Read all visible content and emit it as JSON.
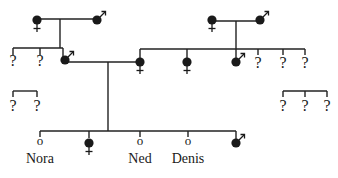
{
  "diagram": {
    "type": "pedigree",
    "colors": {
      "ink": "#1a1a1a",
      "background": "#ffffff"
    },
    "unknown_label": "?",
    "individuals": [
      {
        "id": "lgm",
        "sex": "female",
        "status": "affected",
        "x": 37,
        "y": 20
      },
      {
        "id": "lgf",
        "sex": "male",
        "status": "affected",
        "x": 97,
        "y": 20
      },
      {
        "id": "rgm",
        "sex": "female",
        "status": "affected",
        "x": 212,
        "y": 20
      },
      {
        "id": "rgf",
        "sex": "male",
        "status": "affected",
        "x": 260,
        "y": 20
      },
      {
        "id": "lu1",
        "sex": "unknown",
        "status": "unknown",
        "x": 13,
        "y": 60
      },
      {
        "id": "lu2",
        "sex": "unknown",
        "status": "unknown",
        "x": 40,
        "y": 60
      },
      {
        "id": "father",
        "sex": "male",
        "status": "affected",
        "x": 65,
        "y": 60
      },
      {
        "id": "mother",
        "sex": "female",
        "status": "affected",
        "x": 140,
        "y": 62
      },
      {
        "id": "aunt",
        "sex": "female",
        "status": "affected",
        "x": 187,
        "y": 62
      },
      {
        "id": "uncle",
        "sex": "male",
        "status": "affected",
        "x": 236,
        "y": 62
      },
      {
        "id": "ru1",
        "sex": "unknown",
        "status": "unknown",
        "x": 258,
        "y": 62
      },
      {
        "id": "ru2",
        "sex": "unknown",
        "status": "unknown",
        "x": 283,
        "y": 62
      },
      {
        "id": "ru3",
        "sex": "unknown",
        "status": "unknown",
        "x": 305,
        "y": 62
      },
      {
        "id": "lx1",
        "sex": "unknown",
        "status": "unknown",
        "x": 13,
        "y": 105
      },
      {
        "id": "lx2",
        "sex": "unknown",
        "status": "unknown",
        "x": 37,
        "y": 105
      },
      {
        "id": "rx1",
        "sex": "unknown",
        "status": "unknown",
        "x": 283,
        "y": 105
      },
      {
        "id": "rx2",
        "sex": "unknown",
        "status": "unknown",
        "x": 305,
        "y": 105
      },
      {
        "id": "rx3",
        "sex": "unknown",
        "status": "unknown",
        "x": 327,
        "y": 105
      },
      {
        "id": "nora",
        "sex": "unaffected",
        "status": "unaffected",
        "x": 40,
        "y": 141,
        "name": "Nora"
      },
      {
        "id": "c2",
        "sex": "female",
        "status": "affected",
        "x": 89,
        "y": 143
      },
      {
        "id": "ned",
        "sex": "unaffected",
        "status": "unaffected",
        "x": 140,
        "y": 141,
        "name": "Ned"
      },
      {
        "id": "denis",
        "sex": "unaffected",
        "status": "unaffected",
        "x": 188,
        "y": 141,
        "name": "Denis"
      },
      {
        "id": "c5",
        "sex": "male",
        "status": "affected",
        "x": 236,
        "y": 143
      }
    ],
    "labels": {
      "nora": "Nora",
      "ned": "Ned",
      "denis": "Denis"
    },
    "unaffected_marker": "o"
  }
}
